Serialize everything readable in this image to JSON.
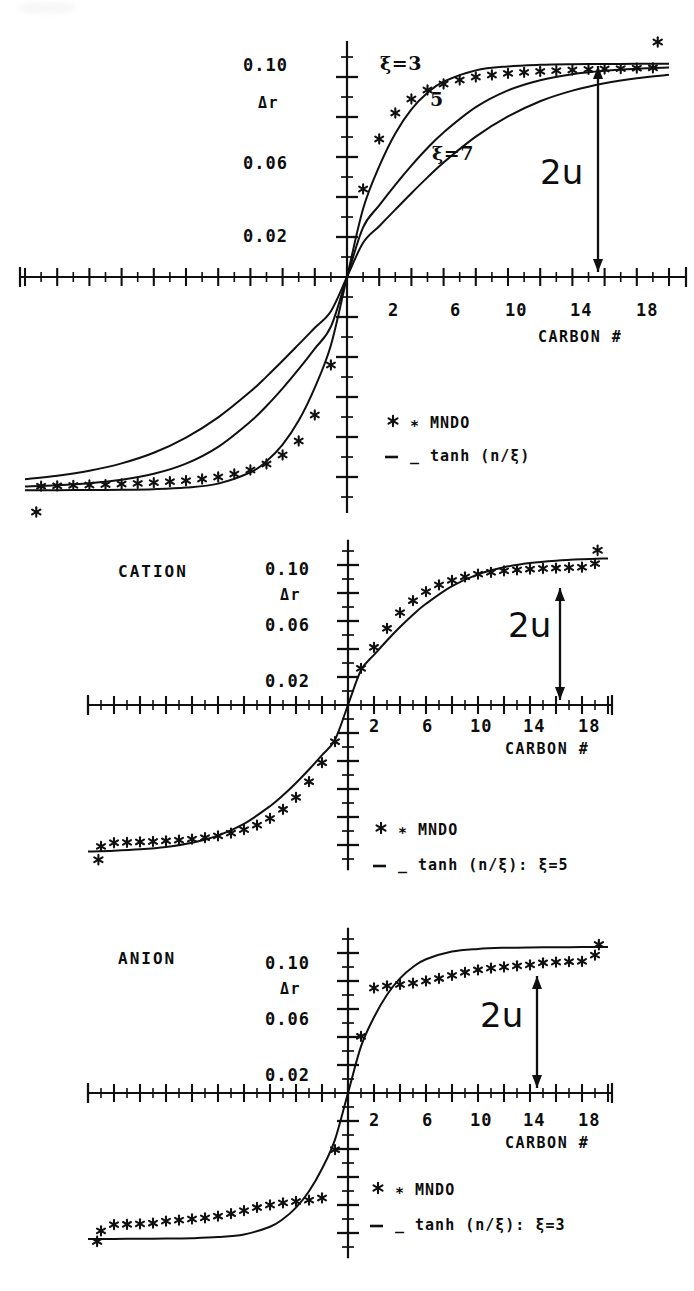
{
  "figure": {
    "background": "#ffffff",
    "ink": "#101010",
    "width": 694,
    "height": 1291
  },
  "common": {
    "y_axis_label": "Δr",
    "x_axis_label": "CARBON #",
    "y_tick_labels": [
      "0.10",
      "0.06",
      "0.02"
    ],
    "y_tick_values": [
      0.1,
      0.06,
      0.02
    ],
    "x_tick_labels": [
      "2",
      "6",
      "10",
      "14",
      "18"
    ],
    "x_tick_values": [
      2,
      6,
      10,
      14,
      18
    ],
    "annotation_2u": "2u",
    "legend_marker_symbol": "∗",
    "legend_line_symbol": "_",
    "legend_mndo": "MNDO"
  },
  "chart_data": [
    {
      "id": "panel-neutral",
      "type": "line",
      "title": "",
      "xlabel": "CARBON #",
      "ylabel": "Δr",
      "xlim": [
        -20,
        20
      ],
      "ylim": [
        -0.115,
        0.115
      ],
      "grid": false,
      "legend_position": "right-middle",
      "legend": [
        "∗ MNDO",
        "_ tanh (n/ξ)"
      ],
      "annotations": [
        {
          "text": "ξ=3",
          "x": 1.6,
          "y": 0.104
        },
        {
          "text": "5",
          "x": 3.6,
          "y": 0.086
        },
        {
          "text": "ξ=7",
          "x": 5.3,
          "y": 0.063
        },
        {
          "text": "2u",
          "x": 13.0,
          "y": 0.045
        }
      ],
      "series": [
        {
          "name": "tanh (n/3)",
          "xi": 3,
          "style": "line",
          "x": [
            -20,
            -18,
            -16,
            -14,
            -12,
            -10,
            -8,
            -6,
            -5,
            -4,
            -3,
            -2,
            -1,
            0,
            1,
            2,
            3,
            4,
            5,
            6,
            8,
            10,
            12,
            14,
            16,
            18,
            20
          ],
          "values": [
            -0.1066,
            -0.1066,
            -0.1065,
            -0.1064,
            -0.1061,
            -0.1053,
            -0.1033,
            -0.0977,
            -0.0921,
            -0.0838,
            -0.0718,
            -0.0553,
            -0.0341,
            0,
            0.0341,
            0.0553,
            0.0718,
            0.0838,
            0.0921,
            0.0977,
            0.1033,
            0.1053,
            0.1061,
            0.1064,
            0.1065,
            0.1066,
            0.1066
          ]
        },
        {
          "name": "tanh (n/5)",
          "xi": 5,
          "style": "line",
          "x": [
            -20,
            -18,
            -16,
            -14,
            -12,
            -10,
            -8,
            -6,
            -5,
            -4,
            -3,
            -2,
            -1,
            0,
            1,
            2,
            3,
            4,
            5,
            6,
            8,
            10,
            12,
            14,
            16,
            18,
            20
          ],
          "values": [
            -0.1047,
            -0.1041,
            -0.1031,
            -0.1014,
            -0.0984,
            -0.0933,
            -0.0849,
            -0.0723,
            -0.0645,
            -0.0557,
            -0.0461,
            -0.0358,
            -0.0248,
            0,
            0.0248,
            0.0358,
            0.0461,
            0.0557,
            0.0645,
            0.0723,
            0.0849,
            0.0933,
            0.0984,
            0.1014,
            0.1031,
            0.1041,
            0.1047
          ]
        },
        {
          "name": "tanh (n/7)",
          "xi": 7,
          "style": "line",
          "x": [
            -20,
            -18,
            -16,
            -14,
            -12,
            -10,
            -8,
            -6,
            -5,
            -4,
            -3,
            -2,
            -1,
            0,
            1,
            2,
            3,
            4,
            5,
            6,
            8,
            10,
            12,
            14,
            16,
            18,
            20
          ],
          "values": [
            -0.1011,
            -0.0994,
            -0.0969,
            -0.0932,
            -0.0879,
            -0.0803,
            -0.0702,
            -0.0573,
            -0.0498,
            -0.0419,
            -0.0337,
            -0.0254,
            -0.0171,
            0,
            0.0171,
            0.0254,
            0.0337,
            0.0419,
            0.0498,
            0.0573,
            0.0702,
            0.0803,
            0.0879,
            0.0932,
            0.0969,
            0.0994,
            0.1011
          ]
        },
        {
          "name": "MNDO",
          "style": "points",
          "x": [
            1,
            2,
            3,
            4,
            5,
            6,
            7,
            8,
            9,
            10,
            11,
            12,
            13,
            14,
            15,
            16,
            17,
            18,
            19
          ],
          "values": [
            0.044,
            0.069,
            0.082,
            0.089,
            0.0935,
            0.0965,
            0.0985,
            0.1,
            0.101,
            0.1018,
            0.1023,
            0.1028,
            0.1032,
            0.1035,
            0.1038,
            0.104,
            0.1042,
            0.1044,
            0.1046
          ]
        },
        {
          "name": "MNDO-negative",
          "style": "points",
          "x": [
            -1,
            -2,
            -3,
            -4,
            -5,
            -6,
            -7,
            -8,
            -9,
            -10,
            -11,
            -12,
            -13,
            -14,
            -15,
            -16,
            -17,
            -18,
            -19
          ],
          "values": [
            -0.044,
            -0.069,
            -0.082,
            -0.089,
            -0.0935,
            -0.0965,
            -0.0985,
            -0.1,
            -0.101,
            -0.1018,
            -0.1023,
            -0.1028,
            -0.1032,
            -0.1035,
            -0.1038,
            -0.104,
            -0.1042,
            -0.1044,
            -0.1046
          ]
        }
      ],
      "outlier_points": [
        {
          "x": 19.3,
          "y": 0.1175
        },
        {
          "x": -19.3,
          "y": -0.1175
        }
      ]
    },
    {
      "id": "panel-cation",
      "type": "line",
      "title": "CATION",
      "xlabel": "CARBON #",
      "ylabel": "Δr",
      "xlim": [
        -20,
        20
      ],
      "ylim": [
        -0.115,
        0.115
      ],
      "grid": false,
      "legend_position": "bottom-right",
      "legend": [
        "∗ MNDO",
        "_ tanh (n/ξ): ξ=5"
      ],
      "annotations": [
        {
          "text": "2u",
          "x": 12.4,
          "y": 0.05
        }
      ],
      "series": [
        {
          "name": "tanh (n/5)",
          "xi": 5,
          "style": "line",
          "x": [
            -20,
            -18,
            -16,
            -14,
            -12,
            -10,
            -8,
            -6,
            -5,
            -4,
            -3,
            -2,
            -1,
            0,
            1,
            2,
            3,
            4,
            5,
            6,
            8,
            10,
            12,
            14,
            16,
            18,
            20
          ],
          "values": [
            -0.1047,
            -0.1041,
            -0.1031,
            -0.1014,
            -0.0984,
            -0.0933,
            -0.0849,
            -0.0723,
            -0.0645,
            -0.0557,
            -0.0461,
            -0.0358,
            -0.0248,
            0,
            0.0248,
            0.0358,
            0.0461,
            0.0557,
            0.0645,
            0.0723,
            0.0849,
            0.0933,
            0.0984,
            0.1014,
            0.1031,
            0.1041,
            0.1047
          ]
        },
        {
          "name": "MNDO",
          "style": "points",
          "x": [
            1,
            2,
            3,
            4,
            5,
            6,
            7,
            8,
            9,
            10,
            11,
            12,
            13,
            14,
            15,
            16,
            17,
            18,
            19
          ],
          "values": [
            0.0262,
            0.0412,
            0.0548,
            0.066,
            0.0745,
            0.081,
            0.0858,
            0.089,
            0.0915,
            0.0935,
            0.0948,
            0.0958,
            0.0965,
            0.097,
            0.0975,
            0.0978,
            0.0981,
            0.0984,
            0.101
          ]
        },
        {
          "name": "MNDO-negative",
          "style": "points",
          "x": [
            -1,
            -2,
            -3,
            -4,
            -5,
            -6,
            -7,
            -8,
            -9,
            -10,
            -11,
            -12,
            -13,
            -14,
            -15,
            -16,
            -17,
            -18,
            -19
          ],
          "values": [
            -0.0262,
            -0.0412,
            -0.0548,
            -0.066,
            -0.0745,
            -0.081,
            -0.0858,
            -0.089,
            -0.0915,
            -0.0935,
            -0.0948,
            -0.0958,
            -0.0965,
            -0.097,
            -0.0975,
            -0.0978,
            -0.0981,
            -0.0984,
            -0.101
          ]
        }
      ],
      "outlier_points": [
        {
          "x": 19.2,
          "y": 0.1105
        },
        {
          "x": -19.2,
          "y": -0.1105
        }
      ]
    },
    {
      "id": "panel-anion",
      "type": "line",
      "title": "ANION",
      "xlabel": "CARBON #",
      "ylabel": "Δr",
      "xlim": [
        -20,
        20
      ],
      "ylim": [
        -0.115,
        0.115
      ],
      "grid": false,
      "legend_position": "bottom-right",
      "legend": [
        "∗ MNDO",
        "_ tanh (n/ξ): ξ=3"
      ],
      "annotations": [
        {
          "text": "2u",
          "x": 11.0,
          "y": 0.046
        }
      ],
      "series": [
        {
          "name": "tanh (n/3)",
          "xi": 3,
          "style": "line",
          "x": [
            -20,
            -18,
            -16,
            -14,
            -12,
            -10,
            -8,
            -6,
            -5,
            -4,
            -3,
            -2,
            -1,
            0,
            1,
            2,
            3,
            4,
            5,
            6,
            8,
            10,
            12,
            14,
            16,
            18,
            20
          ],
          "values": [
            -0.1042,
            -0.1042,
            -0.1041,
            -0.104,
            -0.1037,
            -0.1029,
            -0.101,
            -0.0955,
            -0.09,
            -0.0819,
            -0.0702,
            -0.0541,
            -0.0333,
            0,
            0.0333,
            0.0541,
            0.0702,
            0.0819,
            0.09,
            0.0955,
            0.101,
            0.1029,
            0.1037,
            0.104,
            0.1041,
            0.1042,
            0.1042
          ]
        },
        {
          "name": "MNDO",
          "style": "points",
          "x": [
            1,
            2,
            3,
            4,
            5,
            6,
            7,
            8,
            9,
            10,
            11,
            12,
            13,
            14,
            15,
            16,
            17,
            18,
            19
          ],
          "values": [
            0.0405,
            0.075,
            0.0765,
            0.0775,
            0.0785,
            0.08,
            0.0818,
            0.084,
            0.0862,
            0.088,
            0.0892,
            0.09,
            0.0908,
            0.0915,
            0.093,
            0.0935,
            0.0938,
            0.094,
            0.0985
          ]
        },
        {
          "name": "MNDO-negative",
          "style": "points",
          "x": [
            -1,
            -2,
            -3,
            -4,
            -5,
            -6,
            -7,
            -8,
            -9,
            -10,
            -11,
            -12,
            -13,
            -14,
            -15,
            -16,
            -17,
            -18,
            -19
          ],
          "values": [
            -0.0405,
            -0.075,
            -0.0765,
            -0.0775,
            -0.0785,
            -0.08,
            -0.0818,
            -0.084,
            -0.0862,
            -0.088,
            -0.0892,
            -0.09,
            -0.0908,
            -0.0915,
            -0.093,
            -0.0935,
            -0.0938,
            -0.094,
            -0.0985
          ]
        }
      ],
      "outlier_points": [
        {
          "x": 19.3,
          "y": 0.106
        },
        {
          "x": -19.3,
          "y": -0.106
        }
      ]
    }
  ]
}
